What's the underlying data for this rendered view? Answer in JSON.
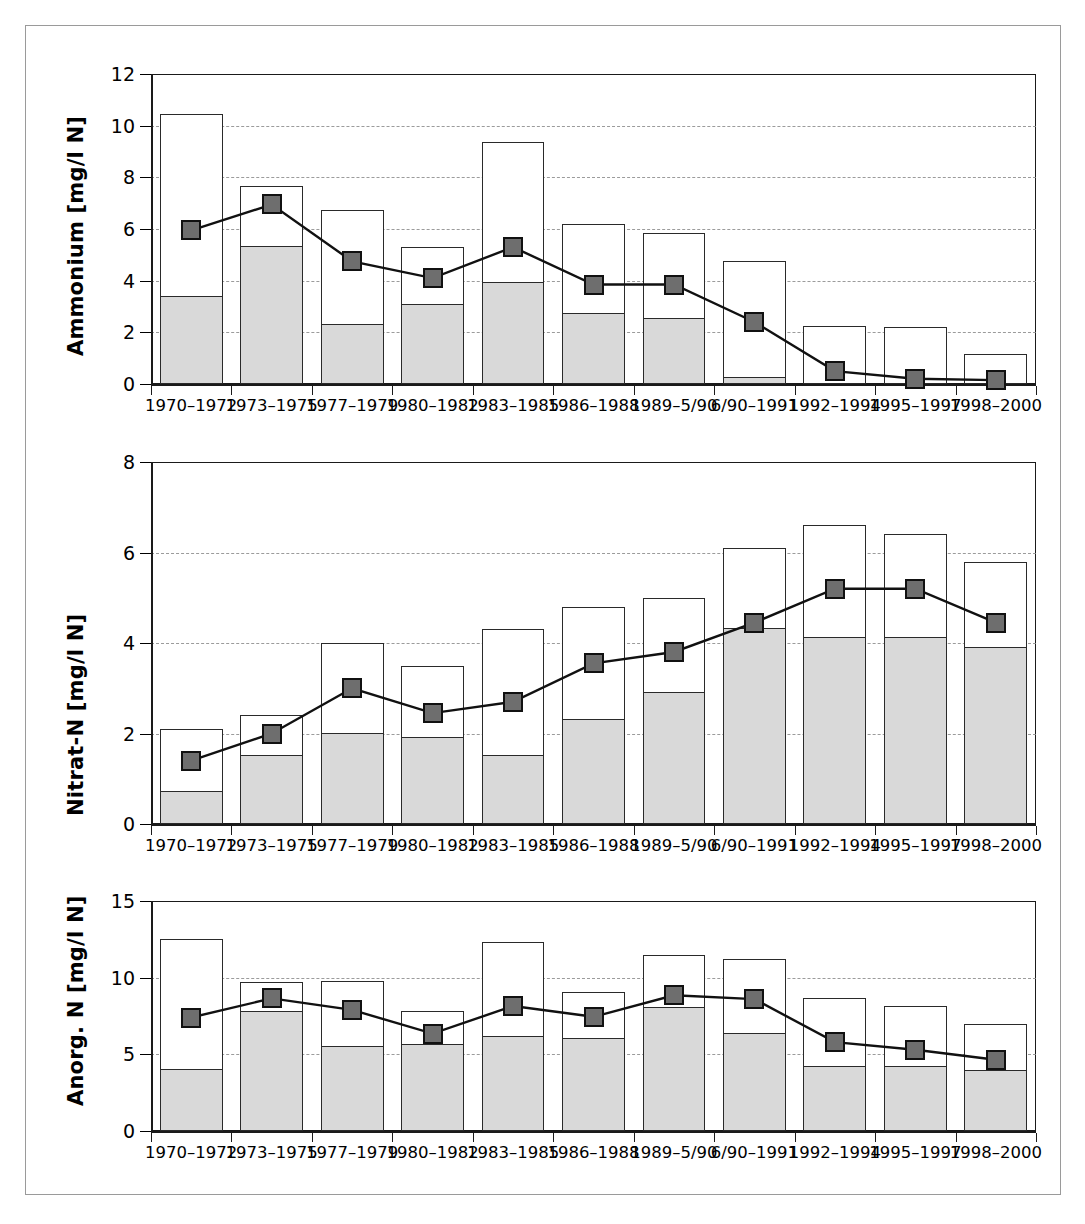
{
  "figure": {
    "background": "#ffffff",
    "frame_color": "#9a9a9a",
    "fill_color": "#d9d9d9",
    "marker_color": "#6e6e6e",
    "line_color": "#111111"
  },
  "categories": [
    "1970–1972",
    "1973–1975",
    "1977–1979",
    "1980–1982",
    "1983–1985",
    "1986–1988",
    "1989–5/90",
    "6/90–1991",
    "1992–1994",
    "1995–1997",
    "1998–2000"
  ],
  "chart_data": [
    {
      "type": "bar",
      "id": "ammonium",
      "title": "",
      "xlabel": "",
      "ylabel": "Ammonium [mg/l N]",
      "ylim": [
        0,
        12
      ],
      "yticks": [
        0,
        2,
        4,
        6,
        8,
        10,
        12
      ],
      "grid": true,
      "legend": "none",
      "categories": [
        "1970–1972",
        "1973–1975",
        "1977–1979",
        "1980–1982",
        "1983–1985",
        "1986–1988",
        "1989–5/90",
        "6/90–1991",
        "1992–1994",
        "1995–1997",
        "1998–2000"
      ],
      "series": [
        {
          "name": "Maximum (bar total)",
          "style": "bar-outline",
          "values": [
            10.45,
            7.65,
            6.75,
            5.3,
            9.35,
            6.2,
            5.85,
            4.75,
            2.25,
            2.2,
            1.15
          ]
        },
        {
          "name": "Minimum (bar filled)",
          "style": "bar-filled",
          "values": [
            3.35,
            5.3,
            2.3,
            3.05,
            3.9,
            2.7,
            2.5,
            0.25,
            0.0,
            0.0,
            0.0
          ]
        },
        {
          "name": "Mittelwert (line)",
          "style": "line-marker",
          "values": [
            5.95,
            6.95,
            4.75,
            4.1,
            5.3,
            3.85,
            3.85,
            2.4,
            0.5,
            0.2,
            0.15
          ]
        }
      ]
    },
    {
      "type": "bar",
      "id": "nitrat-n",
      "title": "",
      "xlabel": "",
      "ylabel": "Nitrat-N [mg/l N]",
      "ylim": [
        0,
        8
      ],
      "yticks": [
        0,
        2,
        4,
        6,
        8
      ],
      "grid": true,
      "legend": "none",
      "categories": [
        "1970–1972",
        "1973–1975",
        "1977–1979",
        "1980–1982",
        "1983–1985",
        "1986–1988",
        "1989–5/90",
        "6/90–1991",
        "1992–1994",
        "1995–1997",
        "1998–2000"
      ],
      "series": [
        {
          "name": "Maximum (bar total)",
          "style": "bar-outline",
          "values": [
            2.1,
            2.4,
            4.0,
            3.5,
            4.3,
            4.8,
            5.0,
            6.1,
            6.6,
            6.4,
            5.8
          ]
        },
        {
          "name": "Minimum (bar filled)",
          "style": "bar-filled",
          "values": [
            0.7,
            1.5,
            2.0,
            1.9,
            1.5,
            2.3,
            2.9,
            4.3,
            4.1,
            4.1,
            3.9
          ]
        },
        {
          "name": "Mittelwert (line)",
          "style": "line-marker",
          "values": [
            1.4,
            2.0,
            3.0,
            2.45,
            2.7,
            3.55,
            3.8,
            4.45,
            5.2,
            5.2,
            4.45
          ]
        }
      ]
    },
    {
      "type": "bar",
      "id": "anorg-n",
      "title": "",
      "xlabel": "",
      "ylabel": "Anorg. N [mg/l N]",
      "ylim": [
        0,
        15
      ],
      "yticks": [
        0,
        5,
        10,
        15
      ],
      "grid": true,
      "legend": "none",
      "categories": [
        "1970–1972",
        "1973–1975",
        "1977–1979",
        "1980–1982",
        "1983–1985",
        "1986–1988",
        "1989–5/90",
        "6/90–1991",
        "1992–1994",
        "1995–1997",
        "1998–2000"
      ],
      "series": [
        {
          "name": "Maximum (bar total)",
          "style": "bar-outline",
          "values": [
            12.55,
            9.7,
            9.8,
            7.8,
            12.3,
            9.05,
            11.45,
            11.2,
            8.65,
            8.15,
            7.0
          ]
        },
        {
          "name": "Minimum (bar filled)",
          "style": "bar-filled",
          "values": [
            4.0,
            7.75,
            5.5,
            5.6,
            6.1,
            6.0,
            8.05,
            6.35,
            4.2,
            4.2,
            3.9
          ]
        },
        {
          "name": "Mittelwert (line)",
          "style": "line-marker",
          "values": [
            7.4,
            8.65,
            7.9,
            6.35,
            8.15,
            7.45,
            8.85,
            8.6,
            5.8,
            5.3,
            4.65
          ]
        }
      ]
    }
  ]
}
